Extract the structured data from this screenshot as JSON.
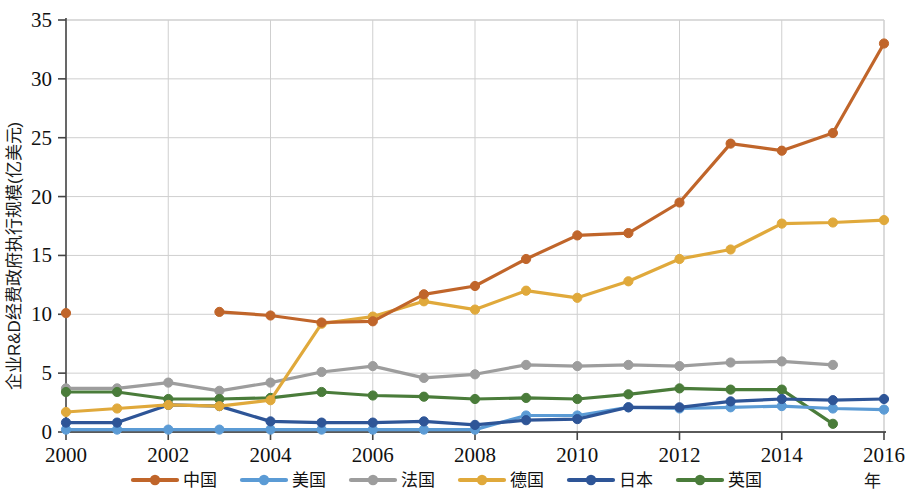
{
  "chart_data": {
    "type": "line",
    "title": "",
    "xlabel": "年",
    "ylabel": "企业R&D经费政府执行规模(亿美元)",
    "xlim": [
      2000,
      2016
    ],
    "ylim": [
      0,
      35
    ],
    "yticks": [
      "0",
      "5",
      "10",
      "15",
      "20",
      "25",
      "30",
      "35"
    ],
    "xticks": [
      "2000",
      "2002",
      "2004",
      "2006",
      "2008",
      "2010",
      "2012",
      "2014",
      "2016"
    ],
    "x": [
      2000,
      2001,
      2002,
      2003,
      2004,
      2005,
      2006,
      2007,
      2008,
      2009,
      2010,
      2011,
      2012,
      2013,
      2014,
      2015,
      2016
    ],
    "grid": true,
    "legend_position": "bottom",
    "series": [
      {
        "name": "中国",
        "color": "#c0652a",
        "marker": "circle",
        "values": [
          10.1,
          null,
          null,
          10.2,
          9.9,
          9.3,
          9.4,
          11.7,
          12.4,
          14.7,
          16.7,
          16.9,
          19.5,
          24.5,
          23.9,
          25.4,
          33.0
        ]
      },
      {
        "name": "美国",
        "color": "#5b9bd5",
        "marker": "circle",
        "values": [
          0.2,
          0.2,
          0.2,
          0.2,
          0.2,
          0.2,
          0.2,
          0.2,
          0.2,
          1.4,
          1.4,
          2.1,
          2.0,
          2.1,
          2.2,
          2.0,
          1.9
        ]
      },
      {
        "name": "法国",
        "color": "#9d9d9d",
        "marker": "circle",
        "values": [
          3.7,
          3.7,
          4.2,
          3.5,
          4.2,
          5.1,
          5.6,
          4.6,
          4.9,
          5.7,
          5.6,
          5.7,
          5.6,
          5.9,
          6.0,
          5.7,
          null
        ]
      },
      {
        "name": "德国",
        "color": "#e0a93b",
        "marker": "circle",
        "values": [
          1.7,
          2.0,
          2.3,
          2.2,
          2.7,
          9.2,
          9.8,
          11.1,
          10.4,
          12.0,
          11.4,
          12.8,
          14.7,
          15.5,
          17.7,
          17.8,
          18.0
        ]
      },
      {
        "name": "日本",
        "color": "#2e5597",
        "marker": "circle",
        "values": [
          0.8,
          0.8,
          2.3,
          2.2,
          0.9,
          0.8,
          0.8,
          0.9,
          0.6,
          1.0,
          1.1,
          2.1,
          2.1,
          2.6,
          2.8,
          2.7,
          2.8
        ]
      },
      {
        "name": "英国",
        "color": "#4a7c3a",
        "marker": "circle",
        "values": [
          3.4,
          3.4,
          2.8,
          2.8,
          2.9,
          3.4,
          3.1,
          3.0,
          2.8,
          2.9,
          2.8,
          3.2,
          3.7,
          3.6,
          3.6,
          0.7,
          null
        ]
      }
    ]
  },
  "legend": {
    "items": [
      {
        "label": "中国",
        "color": "#c0652a"
      },
      {
        "label": "美国",
        "color": "#5b9bd5"
      },
      {
        "label": "法国",
        "color": "#9d9d9d"
      },
      {
        "label": "德国",
        "color": "#e0a93b"
      },
      {
        "label": "日本",
        "color": "#2e5597"
      },
      {
        "label": "英国",
        "color": "#4a7c3a"
      }
    ]
  },
  "axis": {
    "y_title": "企业R&D经费政府执行规模(亿美元)",
    "x_title": "年"
  }
}
